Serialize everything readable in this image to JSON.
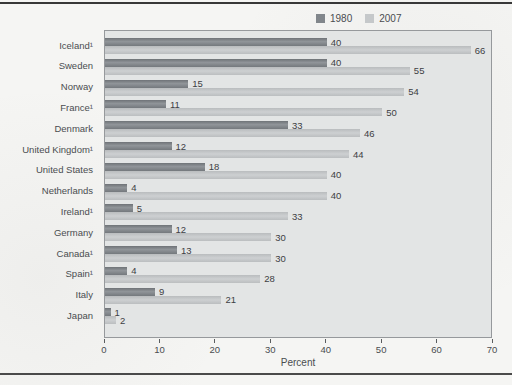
{
  "chart_data": {
    "type": "bar",
    "orientation": "horizontal",
    "xlabel": "Percent",
    "xlim": [
      0,
      70
    ],
    "xticks": [
      0,
      10,
      20,
      30,
      40,
      50,
      60,
      70
    ],
    "grid": false,
    "legend_position": "top-right",
    "value_labels": true,
    "categories": [
      "Iceland¹",
      "Sweden",
      "Norway",
      "France¹",
      "Denmark",
      "United Kingdom¹",
      "United States",
      "Netherlands",
      "Ireland¹",
      "Germany",
      "Canada¹",
      "Spain¹",
      "Italy",
      "Japan"
    ],
    "series": [
      {
        "name": "1980",
        "color": "#81868b",
        "values": [
          40,
          40,
          15,
          11,
          33,
          12,
          18,
          4,
          5,
          12,
          13,
          4,
          9,
          1
        ]
      },
      {
        "name": "2007",
        "color": "#c5c8ca",
        "values": [
          66,
          55,
          54,
          50,
          46,
          44,
          40,
          40,
          33,
          30,
          30,
          28,
          21,
          2
        ]
      }
    ]
  },
  "style": {
    "page_bg": "#f5f5f3",
    "plot_bg": "#e3e5e5",
    "plot_border": "#96999c",
    "bar_1980": "#81868b",
    "bar_2007": "#c5c8ca",
    "text_color": "#45484b",
    "rule_color": "#3c3c3c"
  }
}
